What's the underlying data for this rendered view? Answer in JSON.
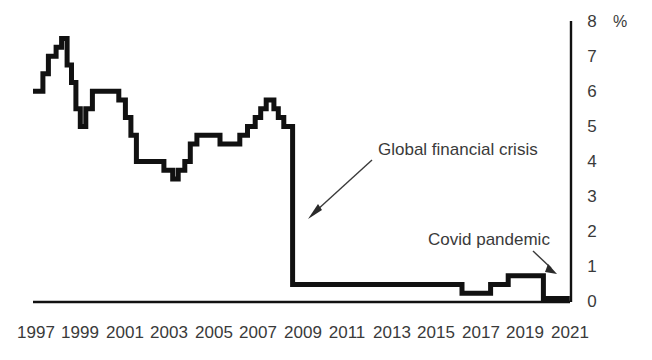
{
  "chart_data": {
    "type": "line",
    "line_style": "step",
    "title": "",
    "subtitle": "",
    "xlabel": "",
    "ylabel": "",
    "unit_label": "%",
    "xlim": [
      1997,
      2021.5
    ],
    "ylim": [
      0,
      8
    ],
    "grid": false,
    "legend": "none",
    "x_tick_labels": [
      "1997",
      "1999",
      "2001",
      "2003",
      "2005",
      "2007",
      "2009",
      "2011",
      "2013",
      "2015",
      "2017",
      "2019",
      "2021"
    ],
    "x_tick_values": [
      1997,
      1999,
      2001,
      2003,
      2005,
      2007,
      2009,
      2011,
      2013,
      2015,
      2017,
      2019,
      2021
    ],
    "y_tick_labels": [
      "0",
      "1",
      "2",
      "3",
      "4",
      "5",
      "6",
      "7",
      "8"
    ],
    "y_tick_values": [
      0,
      1,
      2,
      3,
      4,
      5,
      6,
      7,
      8
    ],
    "y_axis_position": "right",
    "series": [
      {
        "name": "Bank Rate",
        "color": "#111111",
        "points": [
          [
            1997.0,
            6.0
          ],
          [
            1997.45,
            6.0
          ],
          [
            1997.45,
            6.5
          ],
          [
            1997.7,
            6.5
          ],
          [
            1997.7,
            7.0
          ],
          [
            1998.05,
            7.0
          ],
          [
            1998.05,
            7.25
          ],
          [
            1998.3,
            7.25
          ],
          [
            1998.3,
            7.5
          ],
          [
            1998.55,
            7.5
          ],
          [
            1998.55,
            6.75
          ],
          [
            1998.75,
            6.75
          ],
          [
            1998.75,
            6.25
          ],
          [
            1998.95,
            6.25
          ],
          [
            1998.95,
            5.5
          ],
          [
            1999.15,
            5.5
          ],
          [
            1999.15,
            5.0
          ],
          [
            1999.4,
            5.0
          ],
          [
            1999.4,
            5.5
          ],
          [
            1999.7,
            5.5
          ],
          [
            1999.7,
            6.0
          ],
          [
            2000.9,
            6.0
          ],
          [
            2000.9,
            5.75
          ],
          [
            2001.2,
            5.75
          ],
          [
            2001.2,
            5.25
          ],
          [
            2001.45,
            5.25
          ],
          [
            2001.45,
            4.75
          ],
          [
            2001.7,
            4.75
          ],
          [
            2001.7,
            4.0
          ],
          [
            2002.95,
            4.0
          ],
          [
            2002.95,
            3.75
          ],
          [
            2003.35,
            3.75
          ],
          [
            2003.35,
            3.5
          ],
          [
            2003.6,
            3.5
          ],
          [
            2003.6,
            3.75
          ],
          [
            2003.9,
            3.75
          ],
          [
            2003.9,
            4.0
          ],
          [
            2004.15,
            4.0
          ],
          [
            2004.15,
            4.5
          ],
          [
            2004.45,
            4.5
          ],
          [
            2004.45,
            4.75
          ],
          [
            2005.5,
            4.75
          ],
          [
            2005.5,
            4.5
          ],
          [
            2006.4,
            4.5
          ],
          [
            2006.4,
            4.75
          ],
          [
            2006.75,
            4.75
          ],
          [
            2006.75,
            5.0
          ],
          [
            2007.1,
            5.0
          ],
          [
            2007.1,
            5.25
          ],
          [
            2007.35,
            5.25
          ],
          [
            2007.35,
            5.5
          ],
          [
            2007.6,
            5.5
          ],
          [
            2007.6,
            5.75
          ],
          [
            2007.95,
            5.75
          ],
          [
            2007.95,
            5.5
          ],
          [
            2008.15,
            5.5
          ],
          [
            2008.15,
            5.25
          ],
          [
            2008.4,
            5.25
          ],
          [
            2008.4,
            5.0
          ],
          [
            2008.8,
            5.0
          ],
          [
            2008.8,
            0.5
          ],
          [
            2016.5,
            0.5
          ],
          [
            2016.5,
            0.25
          ],
          [
            2017.8,
            0.25
          ],
          [
            2017.8,
            0.5
          ],
          [
            2018.6,
            0.5
          ],
          [
            2018.6,
            0.75
          ],
          [
            2020.2,
            0.75
          ],
          [
            2020.2,
            0.1
          ],
          [
            2021.4,
            0.1
          ]
        ]
      }
    ],
    "annotations": [
      {
        "id": "gfc",
        "text": "Global financial crisis",
        "text_x": 378,
        "text_y": 155,
        "leader_from": [
          372,
          160
        ],
        "leader_to": [
          310,
          216
        ]
      },
      {
        "id": "covid",
        "text": "Covid pandemic",
        "text_x": 428,
        "text_y": 245,
        "leader_from": [
          533,
          251
        ],
        "leader_to": [
          556,
          273
        ]
      }
    ]
  }
}
